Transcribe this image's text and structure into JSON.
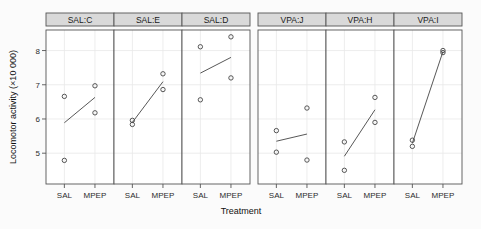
{
  "chart_data": {
    "type": "scatter",
    "title": "",
    "xlabel": "Treatment",
    "ylabel": "Locomotor activity (×10 000)",
    "categories": [
      "SAL",
      "MPEP"
    ],
    "ylim": [
      4.1,
      8.6
    ],
    "yticks": [
      5,
      6,
      7,
      8
    ],
    "ytick_labels": [
      "5",
      "6",
      "7",
      "8"
    ],
    "grid": true,
    "legend": "none",
    "panel_layout": "1 row x 6 columns, grouped 3 + 3",
    "panels": [
      {
        "label": "SAL:C",
        "points": [
          {
            "x": "SAL",
            "y": 6.66
          },
          {
            "x": "SAL",
            "y": 4.79
          },
          {
            "x": "MPEP",
            "y": 6.97
          },
          {
            "x": "MPEP",
            "y": 6.18
          }
        ],
        "line": [
          {
            "x": "SAL",
            "y": 5.89
          },
          {
            "x": "MPEP",
            "y": 6.63
          }
        ]
      },
      {
        "label": "SAL:E",
        "points": [
          {
            "x": "SAL",
            "y": 5.96
          },
          {
            "x": "SAL",
            "y": 5.84
          },
          {
            "x": "MPEP",
            "y": 7.32
          },
          {
            "x": "MPEP",
            "y": 6.86
          }
        ],
        "line": [
          {
            "x": "SAL",
            "y": 5.9
          },
          {
            "x": "MPEP",
            "y": 7.09
          }
        ]
      },
      {
        "label": "SAL:D",
        "points": [
          {
            "x": "SAL",
            "y": 8.11
          },
          {
            "x": "SAL",
            "y": 6.56
          },
          {
            "x": "MPEP",
            "y": 8.4
          },
          {
            "x": "MPEP",
            "y": 7.2
          }
        ],
        "line": [
          {
            "x": "SAL",
            "y": 7.34
          },
          {
            "x": "MPEP",
            "y": 7.8
          }
        ]
      },
      {
        "label": "VPA:J",
        "points": [
          {
            "x": "SAL",
            "y": 5.66
          },
          {
            "x": "SAL",
            "y": 5.03
          },
          {
            "x": "MPEP",
            "y": 6.32
          },
          {
            "x": "MPEP",
            "y": 4.8
          }
        ],
        "line": [
          {
            "x": "SAL",
            "y": 5.35
          },
          {
            "x": "MPEP",
            "y": 5.56
          }
        ]
      },
      {
        "label": "VPA:H",
        "points": [
          {
            "x": "SAL",
            "y": 5.33
          },
          {
            "x": "SAL",
            "y": 4.5
          },
          {
            "x": "MPEP",
            "y": 6.63
          },
          {
            "x": "MPEP",
            "y": 5.9
          }
        ],
        "line": [
          {
            "x": "SAL",
            "y": 4.91
          },
          {
            "x": "MPEP",
            "y": 6.27
          }
        ]
      },
      {
        "label": "VPA:I",
        "points": [
          {
            "x": "SAL",
            "y": 5.38
          },
          {
            "x": "SAL",
            "y": 5.2
          },
          {
            "x": "MPEP",
            "y": 8.0
          },
          {
            "x": "MPEP",
            "y": 7.94
          }
        ],
        "line": [
          {
            "x": "SAL",
            "y": 5.29
          },
          {
            "x": "MPEP",
            "y": 7.97
          }
        ]
      }
    ]
  },
  "axes": {
    "y_title": "Locomotor activity (×10 000)",
    "x_title": "Treatment",
    "y_tick_labels": [
      "8",
      "7",
      "6",
      "5"
    ],
    "x_tick_labels": [
      "SAL",
      "MPEP"
    ]
  },
  "strips": {
    "labels": [
      "SAL:C",
      "SAL:E",
      "SAL:D",
      "VPA:J",
      "VPA:H",
      "VPA:I"
    ]
  },
  "colors": {
    "background": "#fbfbfb",
    "panel_background": "#ffffff",
    "strip_background": "#d9d9d9",
    "border": "#555555",
    "grid": "#e8e8e8",
    "point": "#444444",
    "line": "#444444",
    "text": "#1a1a1a"
  }
}
